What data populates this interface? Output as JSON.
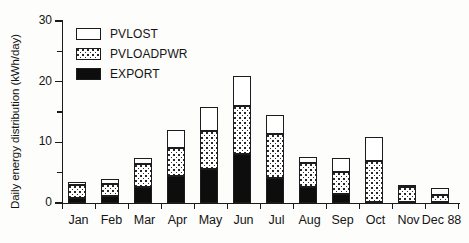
{
  "chart_data": {
    "type": "bar",
    "subtype": "stacked",
    "title": "",
    "xlabel": "",
    "ylabel": "Daily energy distribution (kWh/day)",
    "ylim": [
      0,
      30
    ],
    "yticks": [
      0,
      10,
      20,
      30
    ],
    "yticks_minor": [
      5,
      15,
      25
    ],
    "grid": false,
    "legend_position": "top-left",
    "categories": [
      "Jan",
      "Feb",
      "Mar",
      "Apr",
      "May",
      "Jun",
      "Jul",
      "Aug",
      "Sep",
      "Oct",
      "Nov",
      "Dec 88"
    ],
    "series": [
      {
        "name": "EXPORT",
        "fill": "solid-black",
        "color": "#0d0d0d",
        "values": [
          0.9,
          1.1,
          2.7,
          4.5,
          5.6,
          8.0,
          4.1,
          2.6,
          1.5,
          0.2,
          0.1,
          0.1
        ]
      },
      {
        "name": "PVLOADPWR",
        "fill": "stippled",
        "color": "#ffffff",
        "values": [
          2.1,
          2.0,
          3.8,
          4.5,
          6.2,
          8.0,
          7.2,
          4.0,
          3.6,
          6.8,
          2.5,
          1.3
        ]
      },
      {
        "name": "PVLOST",
        "fill": "white",
        "color": "#ffffff",
        "values": [
          0.5,
          0.8,
          1.0,
          3.0,
          4.0,
          5.0,
          3.2,
          1.0,
          2.4,
          3.8,
          0.4,
          1.1
        ]
      }
    ],
    "totals": [
      3.5,
      3.9,
      7.5,
      12.0,
      15.8,
      21.0,
      14.5,
      7.6,
      7.5,
      10.8,
      3.0,
      2.5
    ]
  },
  "legend": {
    "items": [
      {
        "label": "PVLOST",
        "swatch": "white-swatch"
      },
      {
        "label": "PVLOADPWR",
        "swatch": "stippled-swatch"
      },
      {
        "label": "EXPORT",
        "swatch": "black-swatch"
      }
    ]
  },
  "axes": {
    "y_title": "Daily energy distribution (kWh/day)",
    "y_tick_labels": [
      "0",
      "10",
      "20",
      "30"
    ]
  }
}
